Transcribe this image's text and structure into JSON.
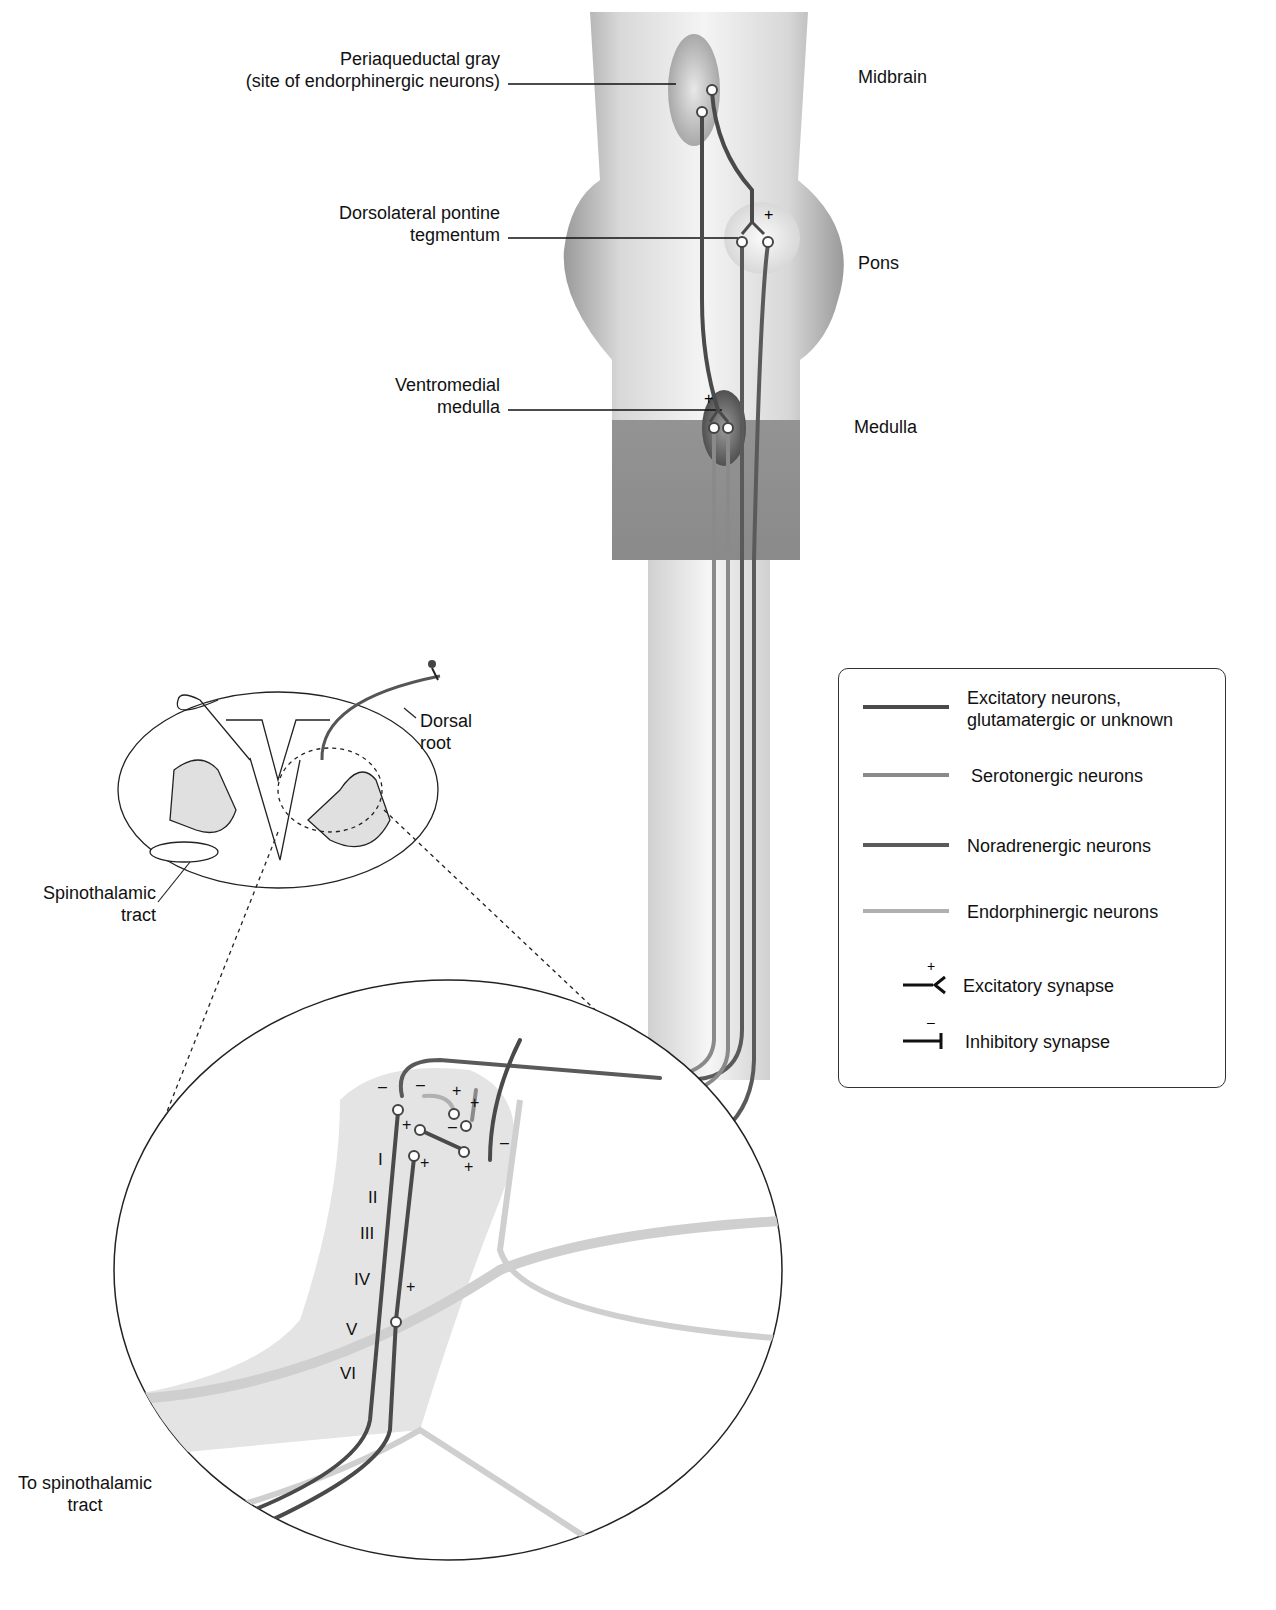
{
  "labels": {
    "periaqueductal_gray": "Periaqueductal gray",
    "periaqueductal_gray_sub": "(site of endorphinergic neurons)",
    "dorsolateral_pontine_1": "Dorsolateral pontine",
    "dorsolateral_pontine_2": "tegmentum",
    "ventromedial_1": "Ventromedial",
    "ventromedial_2": "medulla",
    "midbrain": "Midbrain",
    "pons": "Pons",
    "medulla": "Medulla",
    "dorsal_root_1": "Dorsal",
    "dorsal_root_2": "root",
    "spinothalamic_1": "Spinothalamic",
    "spinothalamic_2": "tract",
    "to_spinothalamic_1": "To spinothalamic",
    "to_spinothalamic_2": "tract"
  },
  "laminae": [
    "I",
    "II",
    "III",
    "IV",
    "V",
    "VI"
  ],
  "legend": {
    "items": [
      {
        "label_1": "Excitatory neurons,",
        "label_2": "glutamatergic or unknown",
        "color": "#4a4a4a"
      },
      {
        "label_1": "Serotonergic neurons",
        "color": "#8a8a8a"
      },
      {
        "label_1": "Noradrenergic neurons",
        "color": "#5a5a5a"
      },
      {
        "label_1": "Endorphinergic neurons",
        "color": "#b0b0b0"
      }
    ],
    "excitatory_synapse": "Excitatory synapse",
    "excitatory_sign": "+",
    "inhibitory_synapse": "Inhibitory synapse",
    "inhibitory_sign": "–"
  }
}
